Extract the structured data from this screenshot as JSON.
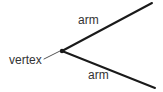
{
  "diagram": {
    "type": "angle-geometry-diagram",
    "background_color": "#ffffff",
    "stroke_color": "#1a1a1a",
    "text_color": "#333333",
    "labels": {
      "vertex": "vertex",
      "arm_upper": "arm",
      "arm_lower": "arm"
    },
    "geometry": {
      "vertex_point": [
        62,
        51
      ],
      "arm_upper_end": [
        152,
        3
      ],
      "arm_lower_end": [
        155,
        88
      ],
      "leader_line_start": [
        44,
        59
      ],
      "leader_line_end": [
        60,
        51
      ],
      "vertex_dot_radius": 2,
      "arm_stroke_width": 2,
      "leader_stroke_width": 1
    }
  }
}
